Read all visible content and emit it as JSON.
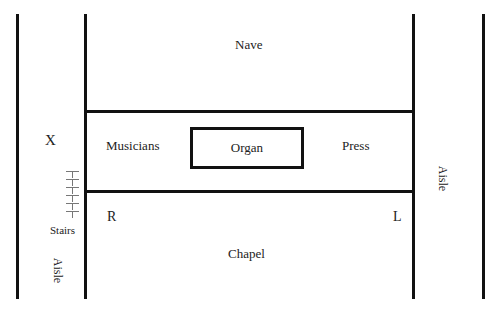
{
  "diagram": {
    "type": "floor-plan",
    "labels": {
      "nave": "Nave",
      "musicians": "Musicians",
      "organ": "Organ",
      "press": "Press",
      "x_mark": "X",
      "stairs": "Stairs",
      "aisle_left": "Aisle",
      "aisle_right": "Aisle",
      "r_mark": "R",
      "l_mark": "L",
      "chapel": "Chapel"
    },
    "stairs_steps": 6,
    "line_color": "#111111"
  }
}
